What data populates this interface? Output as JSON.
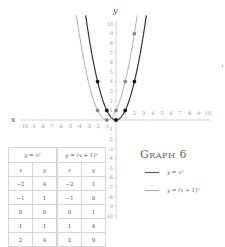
{
  "chart_data": {
    "type": "line",
    "title": "Graph 6",
    "xlabel": "x",
    "ylabel": "y",
    "xlim": [
      -10,
      10
    ],
    "ylim": [
      -10,
      10
    ],
    "x_ticks": [
      -10,
      -9,
      -8,
      -7,
      -6,
      -5,
      -4,
      -3,
      -2,
      -1,
      1,
      2,
      3,
      4,
      5,
      6,
      7,
      8,
      9,
      10
    ],
    "y_ticks": [
      -10,
      -9,
      -8,
      -7,
      -6,
      -5,
      -4,
      -3,
      -2,
      -1,
      1,
      2,
      3,
      4,
      5,
      6,
      7,
      8,
      9,
      10
    ],
    "grid": false,
    "legend_position": "right",
    "series": [
      {
        "name": "y = x²",
        "color": "#333333",
        "x": [
          -2,
          -1,
          0,
          1,
          2
        ],
        "y": [
          4,
          1,
          0,
          1,
          4
        ]
      },
      {
        "name": "y = (x + 1)²",
        "color": "#999999",
        "x": [
          -2,
          -1,
          0,
          1,
          2
        ],
        "y": [
          1,
          0,
          1,
          4,
          9
        ]
      }
    ]
  },
  "graph_title": "Graph 6",
  "axes": {
    "x_label": "x",
    "y_label": "y"
  },
  "legend": [
    {
      "label": "y = x²"
    },
    {
      "label": "y = (x + 1)²"
    }
  ],
  "table": {
    "headers": [
      "y = x²",
      "y = (x + 1)²"
    ],
    "subheaders": [
      "x",
      "y",
      "x",
      "y"
    ],
    "rows": [
      [
        "−2",
        "4",
        "−2",
        "1"
      ],
      [
        "−1",
        "1",
        "−1",
        "0"
      ],
      [
        "0",
        "0",
        "0",
        "1"
      ],
      [
        "1",
        "1",
        "1",
        "4"
      ],
      [
        "2",
        "4",
        "2",
        "9"
      ]
    ]
  }
}
